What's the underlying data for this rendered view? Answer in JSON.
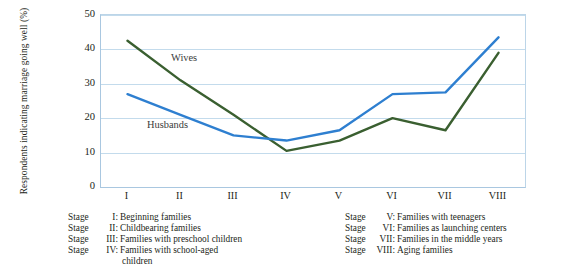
{
  "chart_data": {
    "type": "line",
    "title": "",
    "xlabel": "",
    "ylabel": "Respondents indicating marriage going well (%)",
    "categories": [
      "I",
      "II",
      "III",
      "IV",
      "V",
      "VI",
      "VII",
      "VIII"
    ],
    "ylim": [
      0,
      50
    ],
    "yticks": [
      0,
      10,
      20,
      30,
      40,
      50
    ],
    "grid": true,
    "legend_position": "inline",
    "series": [
      {
        "name": "Wives",
        "color": "#3a5f30",
        "values": [
          42.5,
          31,
          21,
          10.5,
          13.5,
          20,
          16.5,
          39
        ]
      },
      {
        "name": "Husbands",
        "color": "#2e7fd0",
        "values": [
          27,
          21,
          15,
          13.5,
          16.5,
          27,
          27.5,
          43.5
        ]
      }
    ],
    "annotations": [
      {
        "text": "Wives",
        "series": "Wives"
      },
      {
        "text": "Husbands",
        "series": "Husbands"
      }
    ]
  },
  "legend": {
    "left_column": [
      {
        "stage": "Stage",
        "numeral": "I:",
        "description": "Beginning families"
      },
      {
        "stage": "Stage",
        "numeral": "II:",
        "description": "Childbearing families"
      },
      {
        "stage": "Stage",
        "numeral": "III:",
        "description": "Families with preschool children"
      },
      {
        "stage": "Stage",
        "numeral": "IV:",
        "description": "Families with school-aged",
        "continuation": "children"
      }
    ],
    "right_column": [
      {
        "stage": "Stage",
        "numeral": "V:",
        "description": "Families with teenagers"
      },
      {
        "stage": "Stage",
        "numeral": "VI:",
        "description": "Families as launching centers"
      },
      {
        "stage": "Stage",
        "numeral": "VII:",
        "description": "Families in the middle years"
      },
      {
        "stage": "Stage",
        "numeral": "VIII:",
        "description": "Aging families"
      }
    ]
  }
}
